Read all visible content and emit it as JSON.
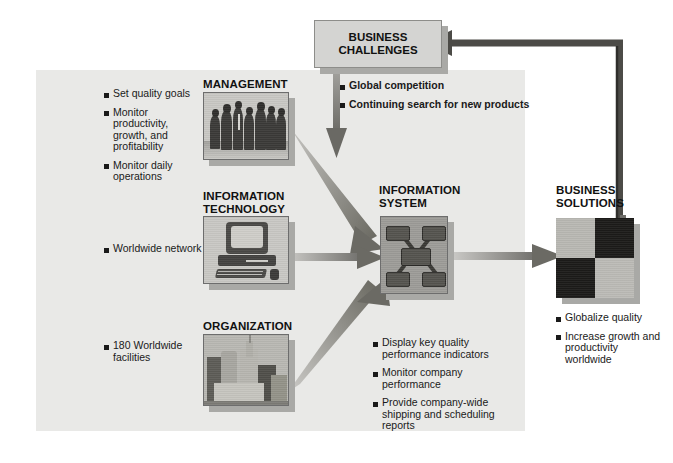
{
  "diagram": {
    "background_color": "#e9e9e7",
    "accent_color": "#6f6e6a"
  },
  "business_challenges": {
    "label": "BUSINESS\nCHALLENGES",
    "line1": "BUSINESS",
    "line2": "CHALLENGES",
    "bullets": [
      "Global competition",
      "Continuing search for new products"
    ]
  },
  "management": {
    "heading": "MANAGEMENT",
    "icon": "group-of-people-photo",
    "bullets": [
      "Set quality goals",
      "Monitor produc-\ntivity, growth,\nand profitability",
      "Monitor daily\noperations"
    ],
    "bullets_flat": [
      "Set quality goals",
      "Monitor productivity, growth, and profitability",
      "Monitor daily operations"
    ]
  },
  "information_technology": {
    "heading_line1": "INFORMATION",
    "heading_line2": "TECHNOLOGY",
    "icon": "desktop-computer-photo",
    "bullets": [
      "Worldwide network"
    ]
  },
  "organization": {
    "heading": "ORGANIZATION",
    "icon": "city-skyline-photo",
    "bullets": [
      "180 Worldwide\nfacilities"
    ],
    "bullets_flat": [
      "180 Worldwide facilities"
    ]
  },
  "information_system": {
    "heading_line1": "INFORMATION",
    "heading_line2": "SYSTEM",
    "icon": "network-hub-diagram",
    "bullets": [
      "Display key quality\nperformance indicators",
      "Monitor company\nperformance",
      "Provide company-wide\nshipping and scheduling\nreports"
    ],
    "bullets_flat": [
      "Display key quality performance indicators",
      "Monitor company performance",
      "Provide company-wide shipping and scheduling reports"
    ]
  },
  "business_solutions": {
    "heading_line1": "BUSINESS",
    "heading_line2": "SOLUTIONS",
    "icon": "checkerboard-quadrants-photo",
    "bullets": [
      "Globalize quality",
      "Increase growth\nand productivity\nworldwide"
    ],
    "bullets_flat": [
      "Globalize quality",
      "Increase growth and productivity worldwide"
    ]
  },
  "connectors": [
    {
      "name": "challenges-down-arrow",
      "from": "business_challenges",
      "to": "management-area",
      "direction": "down"
    },
    {
      "name": "management-to-system-arrow",
      "from": "management",
      "to": "information_system",
      "direction": "down-right"
    },
    {
      "name": "it-to-system-arrow",
      "from": "information_technology",
      "to": "information_system",
      "direction": "right"
    },
    {
      "name": "organization-to-system-arrow",
      "from": "organization",
      "to": "information_system",
      "direction": "up-right"
    },
    {
      "name": "system-to-solutions-arrow",
      "from": "information_system",
      "to": "business_solutions",
      "direction": "right"
    },
    {
      "name": "solutions-feedback-arrow",
      "from": "business_solutions",
      "to": "business_challenges",
      "direction": "up-then-left"
    }
  ]
}
